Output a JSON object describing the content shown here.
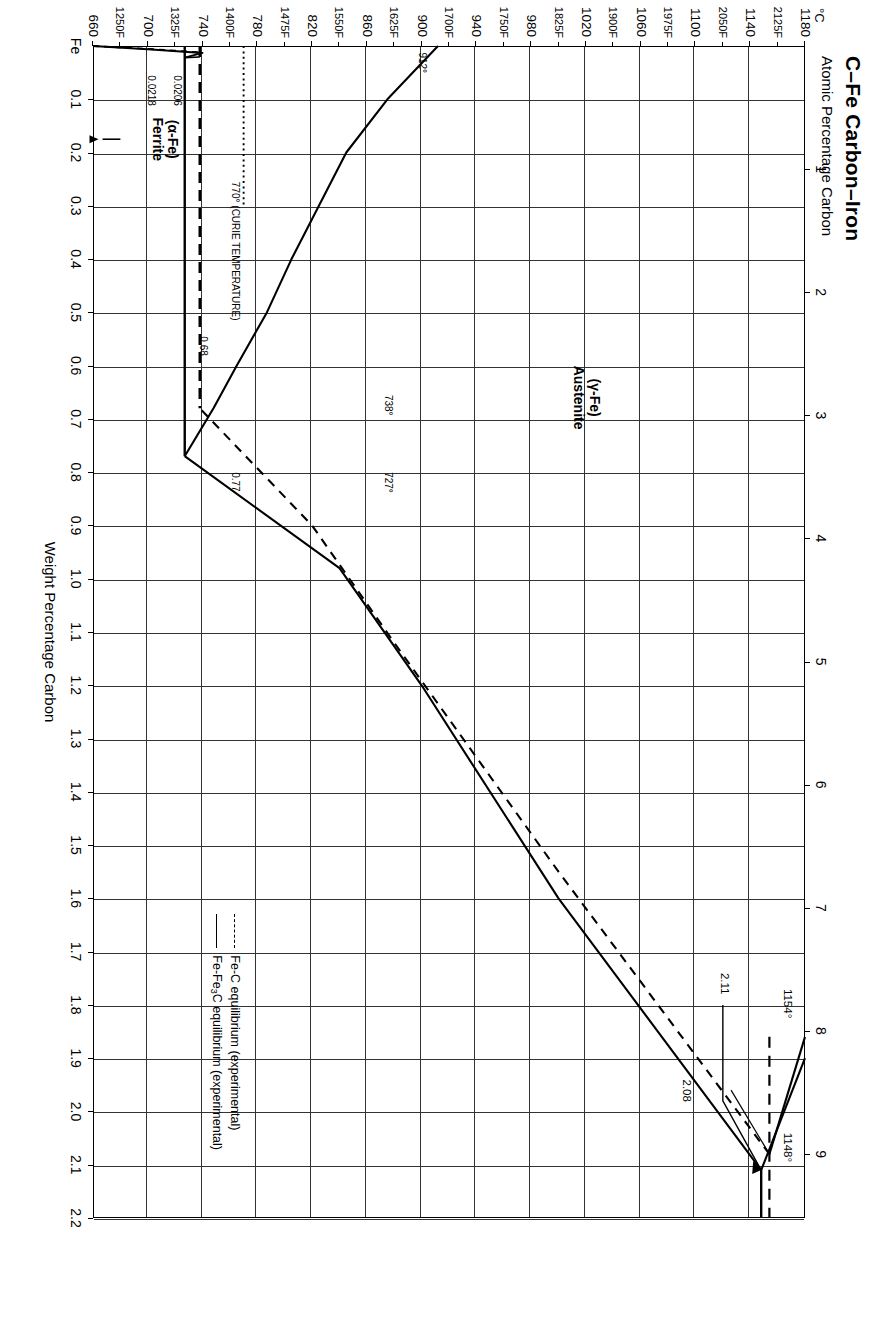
{
  "header": {
    "title": "C–Fe   Carbon–Iron",
    "subtitle": "Atomic Percentage Carbon"
  },
  "axes": {
    "x_title": "Weight Percentage Carbon",
    "y_unit": "°C",
    "x_origin_label": "Fe",
    "x_weight_ticks": [
      "0.1",
      "0.2",
      "0.3",
      "0.4",
      "0.5",
      "0.6",
      "0.7",
      "0.8",
      "0.9",
      "1.0",
      "1.1",
      "1.2",
      "1.3",
      "1.4",
      "1.5",
      "1.6",
      "1.7",
      "1.8",
      "1.9",
      "2.0",
      "2.1",
      "2.2"
    ],
    "x_atomic_ticks": [
      "1",
      "2",
      "3",
      "4",
      "5",
      "6",
      "7",
      "8",
      "9"
    ],
    "y_celsius_ticks": [
      "1180",
      "1140",
      "1100",
      "1060",
      "1020",
      "980",
      "940",
      "900",
      "860",
      "820",
      "780",
      "740",
      "700",
      "660"
    ],
    "y_fahrenheit_ticks": [
      "2125F",
      "2050F",
      "1975F",
      "1900F",
      "1825F",
      "1750F",
      "1700F",
      "1625F",
      "1550F",
      "1475F",
      "1400F",
      "1325F",
      "1250F"
    ]
  },
  "legend": {
    "items": [
      {
        "style": "dashed",
        "label": "Fe-C equilibrium (experimental)"
      },
      {
        "style": "solid",
        "label_pre": "Fe-Fe",
        "label_sub": "3",
        "label_post": "C equilibrium (experimental)"
      }
    ]
  },
  "phases": [
    {
      "id": "austenite",
      "line1": "(γ-Fe)",
      "line2": "Austenite"
    },
    {
      "id": "ferrite",
      "line1": "(α-Fe)",
      "line2": "Ferrite"
    }
  ],
  "annotations": {
    "eutectic_temp_dashed": "1154°",
    "eutectic_temp_solid": "1148°",
    "eutectic_comp_dashed": "2.08",
    "eutectic_comp_solid": "2.11",
    "eutectoid_temp_dashed": "738°",
    "eutectoid_temp_solid": "727°",
    "eutectoid_comp_dashed": "0.68",
    "eutectoid_comp_solid": "0.77",
    "alpha_gamma_temp": "912°",
    "curie": "770° (CURIE TEMPERATURE)",
    "ferrite_solub_dashed": "0.0206",
    "ferrite_solub_solid": "0.0218"
  },
  "chart_data": {
    "type": "line",
    "title": "C–Fe   Carbon–Iron",
    "xlabel": "Weight Percentage Carbon",
    "ylabel": "°C",
    "xlim": [
      0,
      2.2
    ],
    "ylim": [
      660,
      1180
    ],
    "grid": true,
    "legend_position": "bottom-right",
    "secondary_x_axis": {
      "label": "Atomic Percentage Carbon",
      "lim": [
        0,
        9.6
      ],
      "ticks": [
        1,
        2,
        3,
        4,
        5,
        6,
        7,
        8,
        9
      ]
    },
    "secondary_y_axis": {
      "label": "°F",
      "ticks": [
        2125,
        2050,
        1975,
        1900,
        1825,
        1750,
        1700,
        1625,
        1550,
        1475,
        1400,
        1325,
        1250
      ]
    },
    "invariant_points": [
      {
        "name": "Eutectic (Fe-C, metastable graph dashed)",
        "temp_C": 1154,
        "carbon_wt_pct": 2.08
      },
      {
        "name": "Eutectic (Fe-Fe3C solid)",
        "temp_C": 1148,
        "carbon_wt_pct": 2.11
      },
      {
        "name": "Eutectoid (Fe-C dashed)",
        "temp_C": 738,
        "carbon_wt_pct": 0.68
      },
      {
        "name": "Eutectoid (Fe-Fe3C solid)",
        "temp_C": 727,
        "carbon_wt_pct": 0.77
      },
      {
        "name": "alpha/gamma transition pure Fe",
        "temp_C": 912,
        "carbon_wt_pct": 0.0
      },
      {
        "name": "Curie temperature",
        "temp_C": 770,
        "carbon_wt_pct": 0.0
      },
      {
        "name": "Max C in ferrite (Fe-C dashed)",
        "temp_C": 738,
        "carbon_wt_pct": 0.0206
      },
      {
        "name": "Max C in ferrite (Fe-Fe3C solid)",
        "temp_C": 727,
        "carbon_wt_pct": 0.0218
      }
    ],
    "series": [
      {
        "name": "Acm solidus (Fe-Fe3C, solid)",
        "style": "solid",
        "points": [
          [
            2.11,
            1148
          ],
          [
            1.6,
            1000
          ],
          [
            1.2,
            900
          ],
          [
            0.98,
            840
          ],
          [
            0.77,
            727
          ]
        ]
      },
      {
        "name": "Acm solidus (Fe-C, dashed)",
        "style": "dashed",
        "points": [
          [
            2.08,
            1154
          ],
          [
            1.55,
            1000
          ],
          [
            1.12,
            880
          ],
          [
            0.9,
            820
          ],
          [
            0.68,
            738
          ]
        ]
      },
      {
        "name": "Liquidus left of eutectic (solid)",
        "style": "solid",
        "points": [
          [
            1.9,
            1180
          ],
          [
            2.11,
            1148
          ]
        ]
      },
      {
        "name": "A3 gamma/alpha boundary (solid)",
        "style": "solid",
        "points": [
          [
            0.0,
            912
          ],
          [
            0.1,
            875
          ],
          [
            0.2,
            845
          ],
          [
            0.3,
            825
          ],
          [
            0.4,
            805
          ],
          [
            0.5,
            787
          ],
          [
            0.6,
            765
          ],
          [
            0.68,
            748
          ],
          [
            0.77,
            727
          ]
        ]
      },
      {
        "name": "Ferrite solvus (solid)",
        "style": "solid",
        "points": [
          [
            0.0,
            660
          ],
          [
            0.006,
            700
          ],
          [
            0.013,
            740
          ],
          [
            0.0218,
            727
          ]
        ]
      },
      {
        "name": "Ferrite solvus (dashed)",
        "style": "dashed",
        "points": [
          [
            0.0,
            660
          ],
          [
            0.0055,
            700
          ],
          [
            0.012,
            738
          ],
          [
            0.0206,
            738
          ]
        ]
      },
      {
        "name": "Eutectic isotherm 1154 (dashed)",
        "style": "dashed",
        "horizontal": true,
        "temp_C": 1154
      },
      {
        "name": "Eutectic isotherm 1148 (solid)",
        "style": "solid",
        "horizontal": true,
        "temp_C": 1148
      },
      {
        "name": "Eutectoid isotherm 738 (dashed)",
        "style": "dashed",
        "vertical_in_rotated_view": true,
        "temp_C": 738
      },
      {
        "name": "Eutectoid isotherm 727 (solid)",
        "style": "solid",
        "vertical_in_rotated_view": true,
        "temp_C": 727
      },
      {
        "name": "Curie line 770 (dotted)",
        "style": "dotted",
        "temp_C": 770
      }
    ]
  }
}
